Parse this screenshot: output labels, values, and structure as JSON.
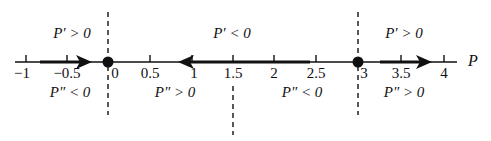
{
  "diagram": {
    "axis_label": "P",
    "ticks": [
      {
        "value": -1,
        "label": "−1",
        "x": 26
      },
      {
        "value": -0.5,
        "label": "−0.5",
        "x": 67
      },
      {
        "value": 0,
        "label": "0",
        "x": 108
      },
      {
        "value": 0.5,
        "label": "0.5",
        "x": 150
      },
      {
        "value": 1,
        "label": "1",
        "x": 192
      },
      {
        "value": 1.5,
        "label": "1.5",
        "x": 233
      },
      {
        "value": 2,
        "label": "2",
        "x": 274
      },
      {
        "value": 2.5,
        "label": "2.5",
        "x": 316
      },
      {
        "value": 3,
        "label": "3",
        "x": 358
      },
      {
        "value": 3.5,
        "label": "3.5",
        "x": 401
      },
      {
        "value": 4,
        "label": "4",
        "x": 444
      }
    ],
    "equilibria": [
      0,
      3
    ],
    "inflection": 1.5,
    "regions_top": [
      {
        "label": "P′ > 0",
        "x": 72
      },
      {
        "label": "P′ < 0",
        "x": 232
      },
      {
        "label": "P′ > 0",
        "x": 404
      }
    ],
    "regions_bottom": [
      {
        "label": "P″ < 0",
        "x": 70
      },
      {
        "label": "P″ > 0",
        "x": 175
      },
      {
        "label": "P″ < 0",
        "x": 302
      },
      {
        "label": "P″ > 0",
        "x": 404
      }
    ],
    "arrows": [
      {
        "from": -0.75,
        "to": -0.1,
        "direction": "right"
      },
      {
        "from": 2.4,
        "to": 0.9,
        "direction": "left"
      },
      {
        "from": 3.2,
        "to": 3.85,
        "direction": "right"
      }
    ]
  }
}
